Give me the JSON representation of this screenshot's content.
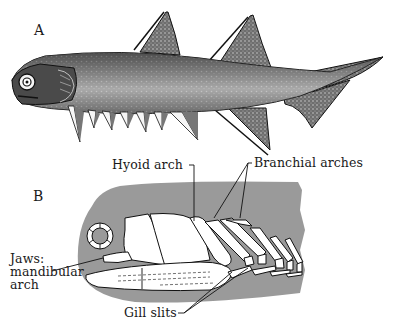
{
  "figure": {
    "panels": [
      {
        "id": "A",
        "label": "A",
        "subject": "early jawed fish (acanthodian) external view, fin spines"
      },
      {
        "id": "B",
        "label": "B",
        "subject": "head skeleton showing jaws, hyoid and branchial arches"
      }
    ],
    "labels": {
      "hyoid": "Hyoid arch",
      "branchial": "Branchial arches",
      "jaws_line1": "Jaws:",
      "jaws_line2": "mandibular",
      "jaws_line3": "arch",
      "gill": "Gill slits"
    },
    "colors": {
      "background": "#ffffff",
      "ink": "#1a1a1a",
      "body_shade": "#8a8a8a",
      "head_silhouette": "#9a9a9a",
      "bone": "#ffffff"
    }
  }
}
